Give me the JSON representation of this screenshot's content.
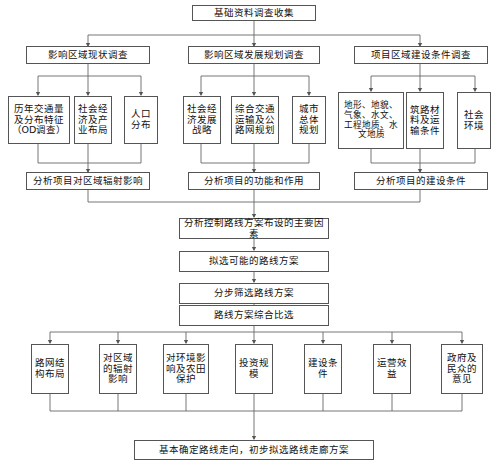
{
  "diagram": {
    "title_box": {
      "label": "基础资料调查收集"
    },
    "level2": [
      {
        "label": "影响区域现状调查"
      },
      {
        "label": "影响区域发展规划调查"
      },
      {
        "label": "项目区域建设条件调查"
      }
    ],
    "level3": [
      {
        "label": "历年交通量及分布特征（OD调查）"
      },
      {
        "label": "社会经济及产业布局"
      },
      {
        "label": "人口分布"
      },
      {
        "label": "社会经济发展战略"
      },
      {
        "label": "综合交通运输及公路网规划"
      },
      {
        "label": "城市总体规划"
      },
      {
        "label": "地形、地貌、气象、水文、工程地质、水文地质"
      },
      {
        "label": "筑路材料及运输条件"
      },
      {
        "label": "社会环境"
      }
    ],
    "level4": [
      {
        "label": "分析项目对区域辐射影响"
      },
      {
        "label": "分析项目的功能和作用"
      },
      {
        "label": "分析项目的建设条件"
      }
    ],
    "chain": [
      {
        "label": "分析控制路线方案布设的主要因素"
      },
      {
        "label": "拟选可能的路线方案"
      },
      {
        "label": "分步筛选路线方案"
      },
      {
        "label": "路线方案综合比选"
      }
    ],
    "criteria": [
      {
        "label": "路网结构布局"
      },
      {
        "label": "对区域的辐射影响"
      },
      {
        "label": "对环境影响及农田保护"
      },
      {
        "label": "投资规模"
      },
      {
        "label": "建设条件"
      },
      {
        "label": "运营效益"
      },
      {
        "label": "政府及民众的意见"
      }
    ],
    "conclusion": {
      "label": "基本确定路线走向，初步拟选路线走廊方案"
    },
    "colors": {
      "box_border": "#555555",
      "box_fill": "#ffffff",
      "connector": "#666666",
      "text": "#111111"
    }
  }
}
